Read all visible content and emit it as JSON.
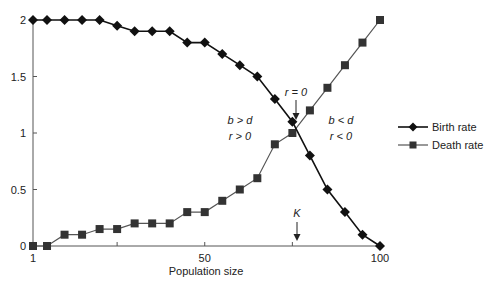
{
  "chart_data": {
    "type": "line",
    "title": "",
    "xlabel": "Population size",
    "ylabel": "",
    "xlim": [
      1,
      100
    ],
    "ylim": [
      0,
      2
    ],
    "grid": false,
    "x_ticks": [
      {
        "value": 1,
        "label": "1"
      },
      {
        "value": 25,
        "label": ""
      },
      {
        "value": 50,
        "label": "50"
      },
      {
        "value": 75,
        "label": ""
      },
      {
        "value": 100,
        "label": "100"
      }
    ],
    "y_ticks": [
      {
        "value": 0,
        "label": "0"
      },
      {
        "value": 0.5,
        "label": "0.5"
      },
      {
        "value": 1,
        "label": "1"
      },
      {
        "value": 1.5,
        "label": "1.5"
      },
      {
        "value": 2,
        "label": "2"
      }
    ],
    "x": [
      1,
      5,
      10,
      15,
      20,
      25,
      30,
      35,
      40,
      45,
      50,
      55,
      60,
      65,
      70,
      75,
      80,
      85,
      90,
      95,
      100
    ],
    "series": [
      {
        "name": "Birth rate",
        "marker": "diamond",
        "color": "#111111",
        "values": [
          2,
          2,
          2,
          2,
          2,
          1.95,
          1.9,
          1.9,
          1.9,
          1.8,
          1.8,
          1.7,
          1.6,
          1.5,
          1.3,
          1.1,
          0.8,
          0.5,
          0.3,
          0.1,
          0
        ]
      },
      {
        "name": "Death rate",
        "marker": "square",
        "color": "#555555",
        "marker_color": "#333333",
        "values": [
          0,
          0,
          0.1,
          0.1,
          0.15,
          0.15,
          0.2,
          0.2,
          0.2,
          0.3,
          0.3,
          0.4,
          0.5,
          0.6,
          0.9,
          1.0,
          1.2,
          1.4,
          1.6,
          1.8,
          2.0
        ]
      }
    ],
    "legend": {
      "placement": "right",
      "entries": [
        "Birth rate",
        "Death rate"
      ]
    },
    "annotations": {
      "r_zero": {
        "text": "r = 0",
        "x": 75,
        "y": 1.05
      },
      "k_label": {
        "text": "K",
        "x": 75,
        "y": 0
      },
      "left_region_line1": "b > d",
      "left_region_line2": "r > 0",
      "right_region_line1": "b < d",
      "right_region_line2": "r < 0"
    }
  }
}
